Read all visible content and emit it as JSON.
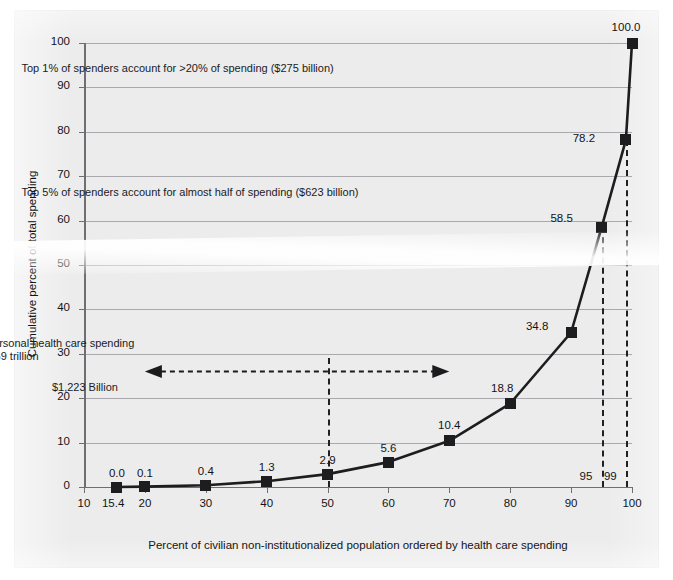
{
  "chart_data": {
    "type": "line",
    "title": "",
    "xlabel": "Percent of civilian non-institutionalized population ordered by health care spending",
    "ylabel": "Cumulative percent of total spending",
    "xlim": [
      10,
      100
    ],
    "ylim": [
      0,
      100
    ],
    "grid": true,
    "legend": "none",
    "x": [
      15.4,
      20,
      30,
      40,
      50,
      60,
      70,
      80,
      90,
      95,
      99,
      100
    ],
    "values": [
      0.0,
      0.1,
      0.4,
      1.3,
      2.9,
      5.6,
      10.4,
      18.8,
      34.8,
      58.5,
      78.2,
      100.0
    ],
    "point_labels": [
      "0.0",
      "0.1",
      "0.4",
      "1.3",
      "2.9",
      "5.6",
      "10.4",
      "18.8",
      "34.8",
      "58.5",
      "78.2",
      "100.0"
    ],
    "x_ticks": [
      "10",
      "20",
      "30",
      "40",
      "50",
      "60",
      "70",
      "80",
      "90",
      "100"
    ],
    "x_tick_values": [
      10,
      20,
      30,
      40,
      50,
      60,
      70,
      80,
      90,
      100
    ],
    "y_ticks": [
      "0",
      "10",
      "20",
      "30",
      "40",
      "50",
      "60",
      "70",
      "80",
      "90",
      "100"
    ],
    "y_tick_values": [
      0,
      10,
      20,
      30,
      40,
      50,
      60,
      70,
      80,
      90,
      100
    ],
    "reference_lines": [
      {
        "label": "15.4",
        "x": 15.4,
        "kind": "axis-note"
      },
      {
        "label": "95",
        "x": 95,
        "kind": "dashed-vertical",
        "to_y": 58.5
      },
      {
        "label": "99",
        "x": 99,
        "kind": "dashed-vertical",
        "to_y": 78.2
      },
      {
        "label": "",
        "x": 50,
        "kind": "dashed-vertical",
        "to_y": 29
      }
    ],
    "annotations": [
      {
        "text": "Top 1% of spenders account for >20%  of spending ($275 billion)",
        "x": 55,
        "y": 94
      },
      {
        "text": "Top 5% of spenders account for almost half of spending ($623 billion)",
        "x": 55,
        "y": 66
      },
      {
        "text": "Total personal health care spending",
        "x": 45,
        "y": 32
      },
      {
        "text": "= $ 1.259 trillion",
        "x": 45,
        "y": 29
      },
      {
        "text": "$36 Billion",
        "x": 35,
        "y": 22
      },
      {
        "text": "$1,223 Billion",
        "x": 60,
        "y": 22
      }
    ],
    "arrow": {
      "x_start": 20,
      "x_end": 70,
      "y": 26,
      "style": "double-headed-dashed"
    }
  },
  "colors": {
    "page_background": "#ececed",
    "plot_background": "#ececed",
    "line": "#1d1d1f",
    "marker": "#1d1d1f",
    "gridline": "#a9a9ad",
    "axis": "#6f6f72",
    "text": "#141414"
  }
}
